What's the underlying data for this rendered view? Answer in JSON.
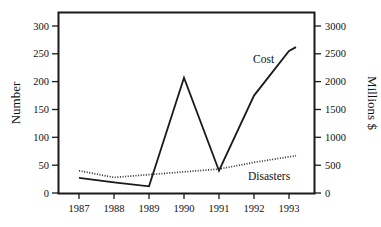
{
  "chart_data": {
    "type": "line",
    "title": "",
    "subtitle": "",
    "xlabel": "",
    "ylabel": "Number",
    "y2label": "Millions $",
    "grid": false,
    "legend_position": "inline-annotation",
    "x": [
      "1987",
      "1988",
      "1989",
      "1990",
      "1991",
      "1992",
      "1993"
    ],
    "categories": [
      "1987",
      "1988",
      "1989",
      "1990",
      "1991",
      "1992",
      "1993"
    ],
    "ylim": [
      0,
      325
    ],
    "y2lim": [
      0,
      3250
    ],
    "xlim": [
      "1987",
      "1993"
    ],
    "yticks": [
      0,
      50,
      100,
      150,
      200,
      250,
      300
    ],
    "ytick_labels": [
      "0",
      "50",
      "100",
      "150",
      "200",
      "250",
      "300"
    ],
    "y2ticks": [
      0,
      500,
      1000,
      1500,
      2000,
      2500,
      3000
    ],
    "y2tick_labels": [
      "0",
      "500",
      "1000",
      "1500",
      "2000",
      "2500",
      "3000"
    ],
    "series": [
      {
        "name": "Cost",
        "axis": "right",
        "style": "solid",
        "color": "#1a1a1a",
        "values": [
          270,
          190,
          120,
          2070,
          400,
          1750,
          2550
        ],
        "values_left_scale": [
          27,
          19,
          12,
          207,
          40,
          175,
          255
        ],
        "annotation": "Cost",
        "annotation_x": "1992",
        "annotation_y": 2300
      },
      {
        "name": "Disasters",
        "axis": "left",
        "style": "dotted",
        "color": "#2a2a2a",
        "values": [
          40,
          28,
          33,
          38,
          43,
          55,
          65
        ],
        "annotation": "Disasters",
        "annotation_x": "1992",
        "annotation_y": 25
      }
    ],
    "annotations": [
      {
        "text": "Cost",
        "series": "Cost"
      },
      {
        "text": "Disasters",
        "series": "Disasters"
      }
    ]
  },
  "axes": {
    "left_title": "Number",
    "right_title": "Millions $"
  }
}
